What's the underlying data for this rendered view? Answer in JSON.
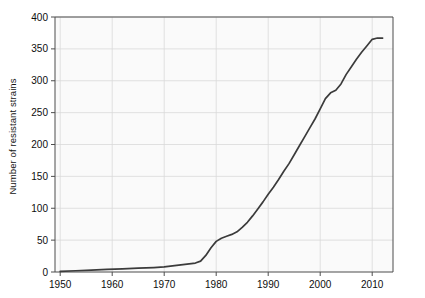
{
  "chart_data": {
    "type": "line",
    "title": "",
    "xlabel": "",
    "ylabel": "Number of resistant strains",
    "xlim": [
      1949,
      2014
    ],
    "ylim": [
      0,
      400
    ],
    "grid": true,
    "legend": "none",
    "x_ticks": [
      1950,
      1960,
      1970,
      1980,
      1990,
      2000,
      2010
    ],
    "y_ticks": [
      0,
      50,
      100,
      150,
      200,
      250,
      300,
      350,
      400
    ],
    "line_color": "#3b3b3b",
    "plot_bg_color": "#fafafa",
    "grid_color": "#d9d9d9",
    "axis_color": "#4d4d4d",
    "series": [
      {
        "name": "Resistant strains",
        "x": [
          1950,
          1953,
          1956,
          1959,
          1962,
          1965,
          1968,
          1970,
          1972,
          1974,
          1976,
          1977,
          1978,
          1979,
          1980,
          1981,
          1982,
          1983,
          1984,
          1985,
          1986,
          1987,
          1988,
          1989,
          1990,
          1991,
          1992,
          1993,
          1994,
          1995,
          1996,
          1997,
          1998,
          1999,
          2000,
          2001,
          2002,
          2003,
          2004,
          2005,
          2006,
          2007,
          2008,
          2009,
          2010,
          2011,
          2012
        ],
        "y": [
          1,
          2,
          3,
          4,
          5,
          6,
          7,
          8,
          10,
          12,
          14,
          17,
          26,
          38,
          48,
          53,
          56,
          59,
          63,
          70,
          78,
          88,
          99,
          110,
          122,
          133,
          145,
          158,
          170,
          184,
          198,
          212,
          226,
          240,
          256,
          272,
          281,
          285,
          295,
          310,
          322,
          334,
          345,
          355,
          365,
          367,
          367
        ]
      }
    ]
  },
  "axis": {
    "y_tick_labels": [
      "0",
      "50",
      "100",
      "150",
      "200",
      "250",
      "300",
      "350",
      "400"
    ],
    "x_tick_labels": [
      "1950",
      "1960",
      "1970",
      "1980",
      "1990",
      "2000",
      "2010"
    ]
  }
}
